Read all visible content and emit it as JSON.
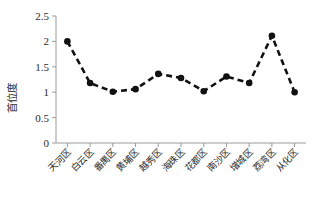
{
  "chart_data": {
    "type": "line",
    "title": "",
    "xlabel": "",
    "ylabel": "首位度",
    "categories": [
      "天河区",
      "白云区",
      "番禺区",
      "黄埔区",
      "越秀区",
      "海珠区",
      "花都区",
      "南沙区",
      "增城区",
      "荔湾区",
      "从化区"
    ],
    "values": [
      2.0,
      1.18,
      1.01,
      1.06,
      1.36,
      1.28,
      1.02,
      1.31,
      1.18,
      2.11,
      1.0
    ],
    "ylim": [
      0,
      2.5
    ],
    "ytick_labels": [
      "0",
      "0.5",
      "1",
      "1.5",
      "2",
      "2.5"
    ],
    "ytick_values": [
      0,
      0.5,
      1,
      1.5,
      2,
      2.5
    ],
    "grid": false,
    "legend": "none",
    "line_style": "dashed",
    "marker": "filled-circle",
    "series_color": "#111111",
    "axis_color": "#9a9a9a"
  }
}
